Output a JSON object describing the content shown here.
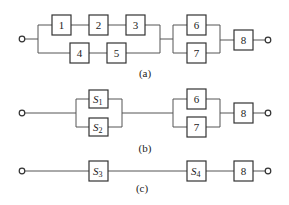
{
  "figure": {
    "diagrams": [
      {
        "id": "a",
        "caption": "(a)",
        "blocks": [
          "1",
          "2",
          "3",
          "4",
          "5",
          "6",
          "7",
          "8"
        ],
        "structure": "((1-2-3) || (4-5)) - (6 || 7) - 8"
      },
      {
        "id": "b",
        "caption": "(b)",
        "blocks": [
          {
            "base": "S",
            "sub": "1"
          },
          {
            "base": "S",
            "sub": "2"
          },
          "6",
          "7",
          "8"
        ],
        "structure": "(S1 || S2) - (6 || 7) - 8"
      },
      {
        "id": "c",
        "caption": "(c)",
        "blocks": [
          {
            "base": "S",
            "sub": "3"
          },
          {
            "base": "S",
            "sub": "4"
          },
          "8"
        ],
        "structure": "S3 - S4 - 8"
      }
    ]
  },
  "a": {
    "b1": "1",
    "b2": "2",
    "b3": "3",
    "b4": "4",
    "b5": "5",
    "b6": "6",
    "b7": "7",
    "b8": "8",
    "caption": "(a)"
  },
  "b": {
    "s1_base": "S",
    "s1_sub": "1",
    "s2_base": "S",
    "s2_sub": "2",
    "b6": "6",
    "b7": "7",
    "b8": "8",
    "caption": "(b)"
  },
  "c": {
    "s3_base": "S",
    "s3_sub": "3",
    "s4_base": "S",
    "s4_sub": "4",
    "b8": "8",
    "caption": "(c)"
  }
}
